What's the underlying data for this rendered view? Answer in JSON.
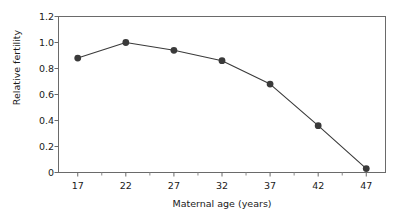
{
  "chart_data": {
    "type": "line",
    "title": "",
    "subtitle": "",
    "xlabel": "Maternal age (years)",
    "ylabel": "Relative fertility",
    "x": [
      17,
      22,
      27,
      32,
      37,
      42,
      47
    ],
    "values": [
      0.88,
      1.0,
      0.94,
      0.86,
      0.68,
      0.36,
      0.03
    ],
    "categories": [
      "17",
      "22",
      "27",
      "32",
      "37",
      "42",
      "47"
    ],
    "series": [
      {
        "name": "Relative fertility",
        "values": [
          0.88,
          1.0,
          0.94,
          0.86,
          0.68,
          0.36,
          0.03
        ]
      }
    ],
    "xlim": [
      15,
      49
    ],
    "ylim": [
      0,
      1.2
    ],
    "xticks": [
      17,
      22,
      27,
      32,
      37,
      42,
      47
    ],
    "yticks": [
      0,
      0.2,
      0.4,
      0.6,
      0.8,
      1.0,
      1.2
    ],
    "ytick_labels": [
      "0",
      "0.2",
      "0.4",
      "0.6",
      "0.8",
      "1.0",
      "1.2"
    ],
    "xtick_labels": [
      "17",
      "22",
      "27",
      "32",
      "37",
      "42",
      "47"
    ],
    "grid": false,
    "legend": false,
    "legend_position": "none",
    "marker": "filled-circle",
    "line_color": "#3a3a3a",
    "marker_color": "#3a3a3a",
    "axis_color": "#5a5a5a",
    "text_color": "#1a1a1a",
    "background": "#ffffff",
    "frame": "box",
    "annotations": []
  },
  "axes": {
    "y_tick_labels": [
      "1.2",
      "1.0",
      "0.8",
      "0.6",
      "0.4",
      "0.2",
      "0"
    ],
    "x_tick_labels": [
      "17",
      "22",
      "27",
      "32",
      "37",
      "42",
      "47"
    ],
    "y_axis_title": "Relative fertility",
    "x_axis_title": "Maternal age (years)"
  }
}
